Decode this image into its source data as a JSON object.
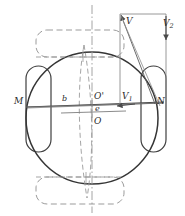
{
  "figure": {
    "type": "technical-line-diagram",
    "canvas": {
      "width": 185,
      "height": 216
    },
    "colors": {
      "solid_line": "#3a3a3a",
      "dashed_line": "#8a8a8a",
      "dashdot_line": "#9a9a9a",
      "thin_line": "#6a6a6a",
      "label_text": "#2b2b2b",
      "background": "#ffffff"
    },
    "labels": [
      {
        "key": "v",
        "text": "V",
        "sub": "",
        "x": 126,
        "y": 22,
        "name": "label-v"
      },
      {
        "key": "v2",
        "text": "V",
        "sub": "2",
        "x": 165,
        "y": 24,
        "name": "label-v2"
      },
      {
        "key": "v1",
        "text": "V",
        "sub": "1",
        "x": 124,
        "y": 97,
        "name": "label-v1"
      },
      {
        "key": "m",
        "text": "M",
        "sub": "",
        "x": 15,
        "y": 101,
        "name": "label-m"
      },
      {
        "key": "n",
        "text": "N",
        "sub": "",
        "x": 159,
        "y": 101,
        "name": "label-n"
      },
      {
        "key": "b",
        "text": "b",
        "sub": "",
        "x": 63,
        "y": 99,
        "name": "label-b"
      },
      {
        "key": "oprime",
        "text": "O'",
        "sub": "",
        "x": 96,
        "y": 96,
        "name": "label-o-prime"
      },
      {
        "key": "e",
        "text": "e",
        "sub": "",
        "x": 97,
        "y": 110,
        "name": "label-e"
      },
      {
        "key": "o",
        "text": "O",
        "sub": "",
        "x": 96,
        "y": 122,
        "name": "label-o"
      }
    ],
    "geometry": {
      "main_circle": {
        "cx": 92,
        "cy": 118,
        "r": 66,
        "stroke": "#3a3a3a",
        "stroke_width": 1.4
      },
      "left_wheel": {
        "x": 26,
        "y": 66,
        "w": 25,
        "h": 86,
        "rx": 12,
        "stroke": "#3a3a3a"
      },
      "right_wheel": {
        "x": 141,
        "y": 66,
        "w": 25,
        "h": 86,
        "rx": 12,
        "stroke": "#3a3a3a"
      },
      "top_wheel_dashed": {
        "x": 36,
        "y": 30,
        "w": 88,
        "h": 27,
        "rx": 12,
        "stroke": "#8a8a8a"
      },
      "bottom_wheel_dashed": {
        "x": 36,
        "y": 177,
        "w": 88,
        "h": 27,
        "rx": 12,
        "stroke": "#8a8a8a"
      },
      "axle_line_mn": {
        "x1": 27,
        "y1": 107,
        "x2": 163,
        "y2": 103
      },
      "vector_rect": {
        "x": 120,
        "y": 14,
        "w": 46,
        "h": 90
      },
      "vertical_centerline": {
        "x": 92,
        "y1": 6,
        "y2": 212
      },
      "horizontal_centerline": {
        "x1": 63,
        "y1": 112,
        "x2": 124,
        "y2": 110
      }
    },
    "vectors": [
      {
        "name": "V",
        "description": "resultant velocity, points up-left"
      },
      {
        "name": "V1",
        "description": "longitudinal component, points left"
      },
      {
        "name": "V2",
        "description": "lateral component, points down"
      }
    ]
  }
}
